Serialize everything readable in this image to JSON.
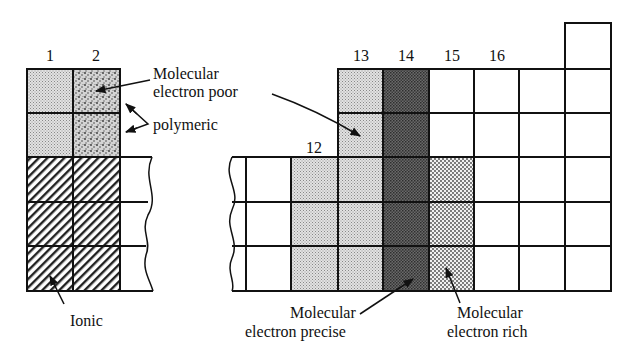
{
  "group_labels": [
    {
      "text": "1",
      "x": 50,
      "y": 61
    },
    {
      "text": "2",
      "x": 96,
      "y": 61
    },
    {
      "text": "12",
      "x": 314,
      "y": 153
    },
    {
      "text": "13",
      "x": 361,
      "y": 61
    },
    {
      "text": "14",
      "x": 406,
      "y": 61
    },
    {
      "text": "15",
      "x": 452,
      "y": 61
    },
    {
      "text": "16",
      "x": 497,
      "y": 61
    }
  ],
  "annotations": {
    "electron_poor": {
      "line1": "Molecular",
      "line2": "electron poor"
    },
    "polymeric": {
      "text": "polymeric"
    },
    "ionic": {
      "text": "Ionic"
    },
    "electron_precise": {
      "line1": "Molecular",
      "line2": "electron precise"
    },
    "electron_rich": {
      "line1": "Molecular",
      "line2": "electron rich"
    }
  },
  "legend_categories": [
    {
      "key": "ionic",
      "name": "Ionic",
      "pattern": "diagonal-hatch"
    },
    {
      "key": "polymeric",
      "name": "polymeric",
      "pattern": "coarse-stipple"
    },
    {
      "key": "electron_poor",
      "name": "Molecular electron poor",
      "pattern": "light-stipple"
    },
    {
      "key": "electron_precise",
      "name": "Molecular electron precise",
      "pattern": "dark-stipple"
    },
    {
      "key": "electron_rich",
      "name": "Molecular electron rich",
      "pattern": "dot-stipple"
    }
  ],
  "colors": {
    "line": "#111111",
    "light": "#d6d6d6",
    "dark": "#555555",
    "background": "#ffffff"
  }
}
